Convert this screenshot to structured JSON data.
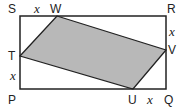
{
  "diagram": {
    "colors": {
      "stroke": "#222222",
      "fill": "#b8b8b8",
      "background": "#ffffff"
    },
    "rectangle": {
      "vertices": [
        "S",
        "R",
        "Q",
        "P"
      ],
      "x1": 20,
      "y1": 16,
      "x2": 166,
      "y2": 89
    },
    "quadrilateral": {
      "vertices": [
        "W",
        "V",
        "U",
        "T"
      ],
      "points": "57,16 166,50 133,89 20,56"
    },
    "labels": {
      "S": "S",
      "W": "W",
      "R": "R",
      "V": "V",
      "T": "T",
      "P": "P",
      "U": "U",
      "Q": "Q"
    },
    "segment_labels": {
      "SW": "x",
      "RV": "x",
      "TP": "x",
      "UQ": "x"
    }
  }
}
